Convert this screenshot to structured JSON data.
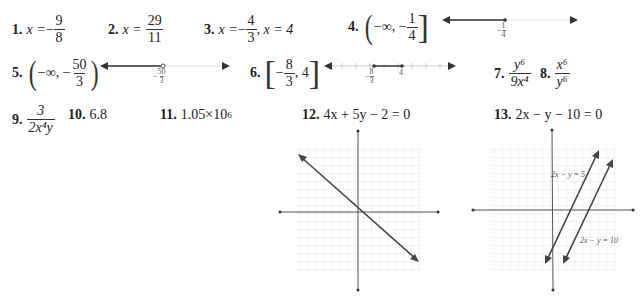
{
  "problems": [
    {
      "number": "1.",
      "lhs": "x =",
      "sign": "−",
      "frac": {
        "num": "9",
        "den": "8"
      }
    },
    {
      "number": "2.",
      "lhs": "x =",
      "frac": {
        "num": "29",
        "den": "11"
      }
    },
    {
      "number": "3.",
      "lhs": "x =",
      "sign": "−",
      "frac": {
        "num": "4",
        "den": "3"
      },
      "rest": ", x = 4"
    },
    {
      "number": "4.",
      "interval_prefix": "−∞, −",
      "frac": {
        "num": "1",
        "den": "4"
      },
      "open": "(",
      "close": "]",
      "numberline": {
        "point_label_sign": "−",
        "point_label_num": "1",
        "point_label_den": "4",
        "point": "closed",
        "shade": "left"
      }
    },
    {
      "number": "5.",
      "interval_prefix": "−∞, −",
      "frac": {
        "num": "50",
        "den": "3"
      },
      "open": "(",
      "close": ")",
      "numberline": {
        "point_label_sign": "−",
        "point_label_num": "50",
        "point_label_den": "3",
        "point": "open",
        "shade": "left"
      }
    },
    {
      "number": "6.",
      "interval_prefix": "−",
      "frac": {
        "num": "8",
        "den": "3"
      },
      "interval_suffix": ", 4",
      "open": "[",
      "close": "]",
      "numberline": {
        "left_label_sign": "−",
        "left_label_num": "8",
        "left_label_den": "3",
        "right_label": "4",
        "points": "closed",
        "shade": "between"
      }
    },
    {
      "number": "7.",
      "frac": {
        "num": "y⁶",
        "den": "9x⁴"
      }
    },
    {
      "number": "8.",
      "frac": {
        "num": "x⁶",
        "den": "y⁶"
      }
    },
    {
      "number": "9.",
      "frac": {
        "num": "3",
        "den": "2x⁴y"
      }
    },
    {
      "number": "10.",
      "value": "6.8"
    },
    {
      "number": "11.",
      "value_base": "1.05×10",
      "value_exp": "6"
    },
    {
      "number": "12.",
      "equation": "4x + 5y − 2 = 0",
      "graph": {
        "lines": [
          {
            "label": "",
            "slope": -0.8,
            "intercept": 0.4
          }
        ]
      }
    },
    {
      "number": "13.",
      "equation": "2x − y − 10 = 0",
      "graph": {
        "lines": [
          {
            "label": "2x − y = 5",
            "slope": 2,
            "intercept": -5
          },
          {
            "label": "2x − y = 10",
            "slope": 2,
            "intercept": -10
          }
        ]
      }
    }
  ]
}
